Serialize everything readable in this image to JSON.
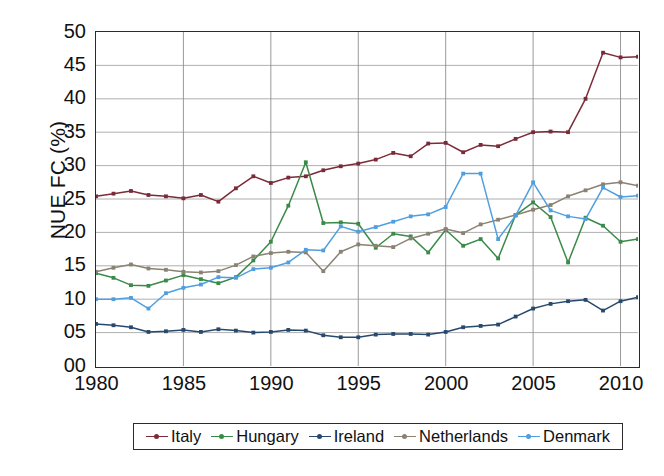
{
  "chart_data": {
    "type": "line",
    "title": "",
    "xlabel": "",
    "ylabel": "NUE FC (%)",
    "xlim": [
      1980,
      2011
    ],
    "ylim": [
      0,
      50
    ],
    "ytick_labels": [
      "50",
      "45",
      "40",
      "35",
      "30",
      "25",
      "20",
      "15",
      "10",
      "05",
      "00"
    ],
    "ytick_values": [
      50,
      45,
      40,
      35,
      30,
      25,
      20,
      15,
      10,
      5,
      0
    ],
    "xtick_labels": [
      "1980",
      "1985",
      "1990",
      "1995",
      "2000",
      "2005",
      "2010"
    ],
    "xtick_values": [
      1980,
      1985,
      1990,
      1995,
      2000,
      2005,
      2010
    ],
    "grid": true,
    "legend_position": "bottom",
    "x": [
      1980,
      1981,
      1982,
      1983,
      1984,
      1985,
      1986,
      1987,
      1988,
      1989,
      1990,
      1991,
      1992,
      1993,
      1994,
      1995,
      1996,
      1997,
      1998,
      1999,
      2000,
      2001,
      2002,
      2003,
      2004,
      2005,
      2006,
      2007,
      2008,
      2009,
      2010,
      2011
    ],
    "series": [
      {
        "name": "Italy",
        "color": "#7b2b38",
        "values": [
          25.4,
          25.8,
          26.2,
          25.6,
          25.4,
          25.1,
          25.6,
          24.6,
          26.6,
          28.4,
          27.4,
          28.2,
          28.4,
          29.3,
          29.9,
          30.3,
          30.9,
          31.9,
          31.4,
          33.3,
          33.4,
          32.0,
          33.1,
          32.9,
          34.0,
          35.0,
          35.1,
          35.0,
          40.0,
          46.9,
          46.2,
          46.3
        ]
      },
      {
        "name": "Hungary",
        "color": "#3a8a48",
        "values": [
          13.9,
          13.2,
          12.1,
          12.0,
          12.8,
          13.6,
          13.0,
          12.4,
          13.3,
          15.8,
          18.6,
          24.0,
          30.5,
          21.4,
          21.5,
          21.3,
          17.7,
          19.8,
          19.4,
          17.0,
          20.4,
          18.0,
          19.0,
          16.1,
          22.6,
          24.5,
          22.3,
          15.5,
          22.2,
          21.0,
          18.6,
          19.0
        ]
      },
      {
        "name": "Ireland",
        "color": "#27496d",
        "values": [
          6.3,
          6.1,
          5.8,
          5.1,
          5.2,
          5.4,
          5.1,
          5.5,
          5.3,
          5.0,
          5.1,
          5.4,
          5.3,
          4.6,
          4.3,
          4.3,
          4.7,
          4.8,
          4.8,
          4.7,
          5.1,
          5.8,
          6.0,
          6.2,
          7.4,
          8.6,
          9.3,
          9.7,
          9.9,
          8.3,
          9.7,
          10.3
        ]
      },
      {
        "name": "Netherlands",
        "color": "#8a8374",
        "values": [
          14.1,
          14.7,
          15.2,
          14.6,
          14.4,
          14.1,
          14.0,
          14.2,
          15.1,
          16.4,
          16.9,
          17.1,
          17.0,
          14.2,
          17.1,
          18.2,
          18.0,
          17.8,
          19.1,
          19.8,
          20.5,
          19.9,
          21.2,
          21.9,
          22.6,
          23.4,
          24.1,
          25.4,
          26.3,
          27.2,
          27.5,
          27.0
        ]
      },
      {
        "name": "Denmark",
        "color": "#4f9fe0",
        "values": [
          10.0,
          10.0,
          10.2,
          8.6,
          10.9,
          11.7,
          12.2,
          13.3,
          13.2,
          14.5,
          14.7,
          15.5,
          17.4,
          17.3,
          20.9,
          20.1,
          20.8,
          21.6,
          22.4,
          22.7,
          23.8,
          28.8,
          28.8,
          19.0,
          22.5,
          27.5,
          23.3,
          22.4,
          22.0,
          26.7,
          25.3,
          25.5
        ]
      }
    ]
  },
  "legend": {
    "items": [
      {
        "label": "Italy"
      },
      {
        "label": "Hungary"
      },
      {
        "label": "Ireland"
      },
      {
        "label": "Netherlands"
      },
      {
        "label": "Denmark"
      }
    ]
  },
  "axes": {
    "y_title": "NUE FC (%)"
  }
}
